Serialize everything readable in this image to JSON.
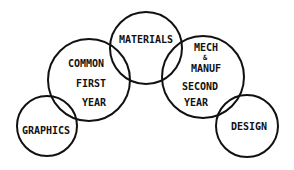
{
  "diagram": {
    "type": "overlapping-circles",
    "stroke_color": "#111111",
    "background": "#ffffff",
    "nodes": [
      {
        "id": "graphics",
        "lines": [
          "GRAPHICS"
        ]
      },
      {
        "id": "common-first-year",
        "lines": [
          "COMMON",
          "FIRST",
          "YEAR"
        ]
      },
      {
        "id": "materials",
        "lines": [
          "MATERIALS"
        ]
      },
      {
        "id": "mech-manuf-second-year",
        "lines": [
          "MECH",
          "&",
          "MANUF",
          "SECOND",
          "YEAR"
        ]
      },
      {
        "id": "design",
        "lines": [
          "DESIGN"
        ]
      }
    ]
  }
}
